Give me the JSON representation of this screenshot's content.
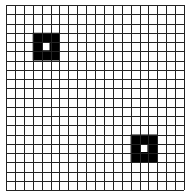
{
  "grid": {
    "columns": 20,
    "rows": 20,
    "origin_x": 6,
    "origin_y": 5,
    "cell_w": 8.9,
    "cell_h": 9.25,
    "line_color": "#222222",
    "background": "#ffffff",
    "fill_color": "#000000"
  },
  "markers": [
    {
      "name": "marker-top-left",
      "col": 3,
      "row": 3,
      "size": 3,
      "hollow_center": true
    },
    {
      "name": "marker-bottom-right",
      "col": 14,
      "row": 14,
      "size": 3,
      "hollow_center": true
    }
  ]
}
